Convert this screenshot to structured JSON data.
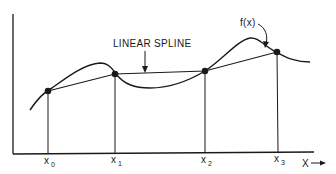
{
  "diagram": {
    "labels": {
      "spline": "LINEAR SPLINE",
      "function": "f(x)",
      "x_axis": "X"
    },
    "knots": [
      {
        "name": "x",
        "sub": "0",
        "px": 48,
        "py": 91
      },
      {
        "name": "x",
        "sub": "1",
        "px": 114,
        "py": 74
      },
      {
        "name": "x",
        "sub": "2",
        "px": 204,
        "py": 71
      },
      {
        "name": "x",
        "sub": "3",
        "px": 276,
        "py": 52
      }
    ],
    "colors": {
      "line": "#1a1a1a",
      "background": "#ffffff"
    }
  }
}
